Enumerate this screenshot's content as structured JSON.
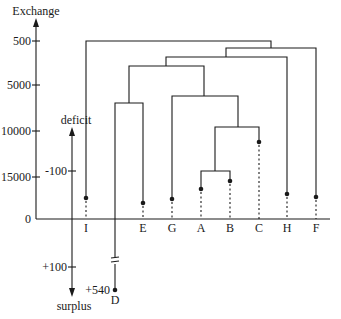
{
  "diagram": {
    "type": "dendrogram",
    "left_axis": {
      "label": "Exchange",
      "ticks": [
        {
          "label": "500",
          "y": 41
        },
        {
          "label": "5000",
          "y": 85
        },
        {
          "label": "10000",
          "y": 131
        },
        {
          "label": "15000",
          "y": 177
        },
        {
          "label": "0",
          "y": 219
        }
      ]
    },
    "balance_axis": {
      "top_label": "deficit",
      "bottom_label": "surplus",
      "ticks": [
        {
          "label": "-100",
          "y": 171
        },
        {
          "label": "+100",
          "y": 267
        }
      ]
    },
    "leaves": [
      {
        "label": "I",
        "x": 86,
        "dot_y": 198
      },
      {
        "label": "E",
        "x": 143,
        "dot_y": 203
      },
      {
        "label": "G",
        "x": 172,
        "dot_y": 199
      },
      {
        "label": "A",
        "x": 201,
        "dot_y": 189
      },
      {
        "label": "B",
        "x": 230,
        "dot_y": 181
      },
      {
        "label": "C",
        "x": 259,
        "dot_y": 142
      },
      {
        "label": "H",
        "x": 287,
        "dot_y": 194
      },
      {
        "label": "F",
        "x": 316,
        "dot_y": 197
      }
    ],
    "outlier": {
      "label": "D",
      "value_label": "+540",
      "x": 115,
      "dot_y": 290
    },
    "merges": [
      {
        "left": "A",
        "right": "B",
        "height_y": 171
      },
      {
        "left": "AB",
        "right": "C",
        "height_y": 127
      },
      {
        "left": "G",
        "right": "ABC",
        "height_y": 96
      },
      {
        "left": "D",
        "right": "E",
        "height_y": 103
      },
      {
        "left": "DE",
        "right": "GABC",
        "height_y": 66
      },
      {
        "left": "DEGABC",
        "right": "H",
        "height_y": 57
      },
      {
        "left": "DEGABCH",
        "right": "F",
        "height_y": 48
      },
      {
        "left": "I",
        "right": "DEGABCHF",
        "height_y": 41
      }
    ]
  },
  "labels": {
    "exchange": "Exchange",
    "deficit": "deficit",
    "surplus": "surplus",
    "t500": "500",
    "t5000": "5000",
    "t10000": "10000",
    "t15000": "15000",
    "t0": "0",
    "tm100": "-100",
    "tp100": "+100",
    "tp540": "+540",
    "leafI": "I",
    "leafE": "E",
    "leafG": "G",
    "leafA": "A",
    "leafB": "B",
    "leafC": "C",
    "leafH": "H",
    "leafF": "F",
    "leafD": "D"
  }
}
